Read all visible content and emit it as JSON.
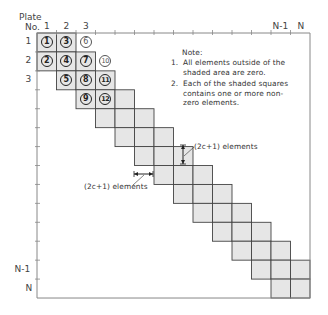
{
  "axis": {
    "corner_label_line1": "Plate",
    "corner_label_line2": "No.",
    "col_labels": [
      {
        "text": "1",
        "col": 0
      },
      {
        "text": "2",
        "col": 1
      },
      {
        "text": "3",
        "col": 2
      },
      {
        "text": "N-1",
        "col": 12
      },
      {
        "text": "N",
        "col": 13
      }
    ],
    "row_labels": [
      {
        "text": "1",
        "row": 0
      },
      {
        "text": "2",
        "row": 1
      },
      {
        "text": "3",
        "row": 2
      },
      {
        "text": "N-1",
        "row": 12
      },
      {
        "text": "N",
        "row": 13
      }
    ]
  },
  "grid": {
    "size": 14,
    "shaded_color": "#e6e6e6",
    "line_color": "#444444",
    "band": "tridiagonal"
  },
  "numbered_elements": [
    {
      "n": "1",
      "row": 0,
      "col": 0
    },
    {
      "n": "2",
      "row": 1,
      "col": 0
    },
    {
      "n": "3",
      "row": 0,
      "col": 1
    },
    {
      "n": "4",
      "row": 1,
      "col": 1
    },
    {
      "n": "5",
      "row": 2,
      "col": 1
    },
    {
      "n": "6",
      "row": 0,
      "col": 2
    },
    {
      "n": "7",
      "row": 1,
      "col": 2
    },
    {
      "n": "8",
      "row": 2,
      "col": 2
    },
    {
      "n": "9",
      "row": 3,
      "col": 2
    },
    {
      "n": "10",
      "row": 1,
      "col": 3
    },
    {
      "n": "11",
      "row": 2,
      "col": 3
    },
    {
      "n": "12",
      "row": 3,
      "col": 3
    }
  ],
  "note": {
    "title": "Note:",
    "items": [
      {
        "num": "1.",
        "lines": [
          "All elements outside of the",
          "shaded area are zero."
        ]
      },
      {
        "num": "2.",
        "lines": [
          "Each of the shaded squares",
          "contains one or more non-",
          "zero elements."
        ]
      }
    ]
  },
  "annotations": {
    "vertical": "(2c+1) elements",
    "horizontal": "(2c+1) elements"
  }
}
